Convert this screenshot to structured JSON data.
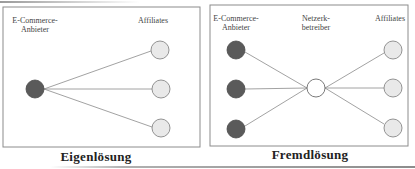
{
  "left_panel": {
    "caption": "Eigenlösung",
    "labels": {
      "merchant_line1": "E-Commerce-",
      "merchant_line2": "Anbieter",
      "affiliates": "Affiliates"
    },
    "merchants": [
      {
        "cx": 35,
        "cy": 89
      }
    ],
    "affiliates": [
      {
        "cx": 160,
        "cy": 50
      },
      {
        "cx": 161,
        "cy": 89
      },
      {
        "cx": 161,
        "cy": 128
      }
    ]
  },
  "right_panel": {
    "caption": "Fremdlösung",
    "labels": {
      "merchant_line1": "E-Commerce-",
      "merchant_line2": "Anbieter",
      "network_line1": "Netzerk-",
      "network_line2": "betreiber",
      "affiliates": "Affiliates"
    },
    "merchants": [
      {
        "cx": 236,
        "cy": 50
      },
      {
        "cx": 236,
        "cy": 89
      },
      {
        "cx": 236,
        "cy": 129
      }
    ],
    "network": {
      "cx": 316,
      "cy": 88
    },
    "affiliates": [
      {
        "cx": 393,
        "cy": 50
      },
      {
        "cx": 393,
        "cy": 88
      },
      {
        "cx": 393,
        "cy": 128
      }
    ]
  },
  "colors": {
    "merchant_fill": "#5a5a5a",
    "affiliate_fill": "#e9e9e9",
    "network_fill": "#ffffff",
    "node_stroke": "#7a7a7a",
    "edge": "#8a8a8a",
    "frame": "#8c8c8c"
  }
}
